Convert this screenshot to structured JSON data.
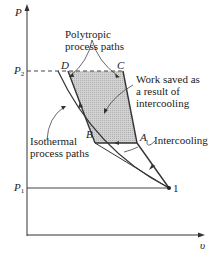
{
  "diagram": {
    "type": "P-v diagram",
    "axes": {
      "y_label": "P",
      "x_label": "υ",
      "p2_label": "P",
      "p2_sub": "2",
      "p1_label": "P",
      "p1_sub": "1"
    },
    "points": {
      "D": "D",
      "C": "C",
      "A": "A",
      "B": "B",
      "one": "1"
    },
    "annotations": {
      "polytropic_line1": "Polytropic",
      "polytropic_line2": "process paths",
      "work_saved_line1": "Work saved as",
      "work_saved_line2": "a result of",
      "work_saved_line3": "intercooling",
      "isothermal_line1": "Isothermal",
      "isothermal_line2": "process paths",
      "intercooling": "Intercooling"
    },
    "colors": {
      "line": "#333333",
      "shade": "#c8c8c8"
    }
  }
}
